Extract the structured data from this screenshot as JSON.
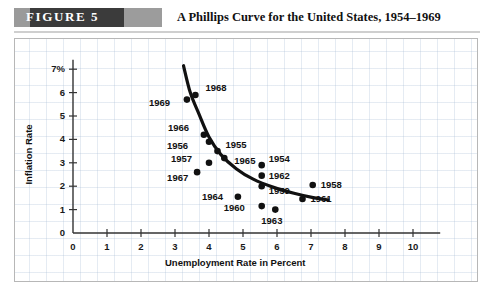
{
  "figure": {
    "badge_label": "FIGURE 5",
    "title": "A Phillips Curve for the United States, 1954–1969"
  },
  "chart_data": {
    "type": "scatter",
    "title": "A Phillips Curve for the United States, 1954–1969",
    "xlabel": "Unemployment Rate in Percent",
    "ylabel": "Inflation Rate",
    "xlim": [
      0,
      10.8
    ],
    "ylim": [
      0,
      7.4
    ],
    "grid": true,
    "legend": "none",
    "x_ticks": [
      "0",
      "1",
      "2",
      "3",
      "4",
      "5",
      "6",
      "7",
      "8",
      "9",
      "10"
    ],
    "x_tick_values": [
      0,
      1,
      2,
      3,
      4,
      5,
      6,
      7,
      8,
      9,
      10
    ],
    "y_ticks": [
      "0",
      "1",
      "2",
      "3",
      "4",
      "5",
      "6",
      "7%"
    ],
    "y_tick_values": [
      0,
      1,
      2,
      3,
      4,
      5,
      6,
      7
    ],
    "point_label_key": "year",
    "points": [
      {
        "year": "1968",
        "x": 3.6,
        "y": 5.9,
        "lx": 10,
        "ly": -7
      },
      {
        "year": "1969",
        "x": 3.35,
        "y": 5.7,
        "lx": -38,
        "ly": 3
      },
      {
        "year": "1966",
        "x": 3.85,
        "y": 4.2,
        "lx": -36,
        "ly": -7
      },
      {
        "year": "1956",
        "x": 4.0,
        "y": 3.9,
        "lx": -42,
        "ly": 4
      },
      {
        "year": "1955",
        "x": 4.25,
        "y": 3.5,
        "lx": 8,
        "ly": -6
      },
      {
        "year": "1965",
        "x": 4.45,
        "y": 3.2,
        "lx": 10,
        "ly": 3
      },
      {
        "year": "1957",
        "x": 4.0,
        "y": 3.0,
        "lx": -38,
        "ly": -4
      },
      {
        "year": "1967",
        "x": 3.65,
        "y": 2.6,
        "lx": -30,
        "ly": 6
      },
      {
        "year": "1954",
        "x": 5.55,
        "y": 2.9,
        "lx": 7,
        "ly": -6
      },
      {
        "year": "1962",
        "x": 5.55,
        "y": 2.45,
        "lx": 7,
        "ly": 0
      },
      {
        "year": "1959",
        "x": 5.55,
        "y": 2.0,
        "lx": 7,
        "ly": 5
      },
      {
        "year": "1958",
        "x": 7.05,
        "y": 2.05,
        "lx": 8,
        "ly": 0
      },
      {
        "year": "1961",
        "x": 6.75,
        "y": 1.45,
        "lx": 8,
        "ly": 0
      },
      {
        "year": "1964",
        "x": 4.85,
        "y": 1.55,
        "lx": -36,
        "ly": 0
      },
      {
        "year": "1960",
        "x": 5.55,
        "y": 1.15,
        "lx": -38,
        "ly": 2
      },
      {
        "year": "1963",
        "x": 5.95,
        "y": 1.0,
        "lx": -14,
        "ly": 11
      }
    ],
    "curve": {
      "label": "Phillips curve",
      "color": "#111111",
      "width": 3.2,
      "points": [
        {
          "x": 3.25,
          "y": 7.15
        },
        {
          "x": 3.45,
          "y": 6.0
        },
        {
          "x": 3.7,
          "y": 5.1
        },
        {
          "x": 4.0,
          "y": 4.1
        },
        {
          "x": 4.35,
          "y": 3.35
        },
        {
          "x": 4.8,
          "y": 2.75
        },
        {
          "x": 5.3,
          "y": 2.3
        },
        {
          "x": 5.9,
          "y": 1.95
        },
        {
          "x": 6.5,
          "y": 1.7
        },
        {
          "x": 7.1,
          "y": 1.5
        },
        {
          "x": 7.5,
          "y": 1.42
        }
      ]
    }
  }
}
